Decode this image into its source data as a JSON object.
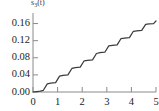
{
  "chart_data": {
    "type": "line",
    "title": "s3(t)",
    "title_base": "s",
    "title_sub": "3",
    "title_arg": "(t)",
    "xlabel": "",
    "ylabel": "",
    "xlim": [
      0,
      5
    ],
    "ylim": [
      0,
      0.18
    ],
    "grid": false,
    "legend": null,
    "line_color": "#3c3c3c",
    "axis_color": "#8a8a8a",
    "text_color": "#1d1d1d",
    "xticks": [
      0,
      1,
      2,
      3,
      4,
      5
    ],
    "xtick_labels": [
      "0",
      "1",
      "2",
      "3",
      "4",
      "5"
    ],
    "yticks": [
      0.0,
      0.04,
      0.08,
      0.12,
      0.16
    ],
    "ytick_labels": [
      "0.00",
      "0.04",
      "0.08",
      "0.12",
      "0.16"
    ],
    "x": [
      0.0,
      0.35,
      0.5,
      0.75,
      1.0,
      1.25,
      1.5,
      1.75,
      2.0,
      2.25,
      2.5,
      2.75,
      3.0,
      3.25,
      3.5,
      3.75,
      4.0,
      4.25,
      4.5,
      4.75,
      5.0
    ],
    "y": [
      0.0,
      0.003,
      0.004,
      0.02,
      0.021,
      0.037,
      0.038,
      0.054,
      0.055,
      0.071,
      0.072,
      0.088,
      0.089,
      0.104,
      0.105,
      0.12,
      0.121,
      0.136,
      0.137,
      0.152,
      0.166
    ],
    "series": [
      {
        "name": "s3(t)",
        "points": [
          [
            0.0,
            0.0
          ],
          [
            0.3,
            0.002
          ],
          [
            0.42,
            0.004
          ],
          [
            0.58,
            0.019
          ],
          [
            0.72,
            0.021
          ],
          [
            0.92,
            0.022
          ],
          [
            1.08,
            0.037
          ],
          [
            1.22,
            0.039
          ],
          [
            1.42,
            0.04
          ],
          [
            1.58,
            0.055
          ],
          [
            1.72,
            0.057
          ],
          [
            1.92,
            0.058
          ],
          [
            2.08,
            0.073
          ],
          [
            2.22,
            0.074
          ],
          [
            2.42,
            0.075
          ],
          [
            2.58,
            0.09
          ],
          [
            2.72,
            0.092
          ],
          [
            2.92,
            0.093
          ],
          [
            3.08,
            0.108
          ],
          [
            3.22,
            0.109
          ],
          [
            3.42,
            0.11
          ],
          [
            3.58,
            0.125
          ],
          [
            3.72,
            0.126
          ],
          [
            3.92,
            0.127
          ],
          [
            4.08,
            0.142
          ],
          [
            4.22,
            0.143
          ],
          [
            4.42,
            0.144
          ],
          [
            4.58,
            0.158
          ],
          [
            4.72,
            0.159
          ],
          [
            4.9,
            0.16
          ],
          [
            5.0,
            0.166
          ]
        ]
      }
    ]
  }
}
